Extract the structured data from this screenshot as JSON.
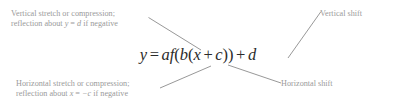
{
  "figure": {
    "background_color": "#ffffff",
    "label_color": "#9a9a9a",
    "equation_color": "#2b2b2b",
    "leader_line_color": "#8c8c8c"
  },
  "equation": {
    "full_text": "y = af(b(x + c)) + d",
    "lhs": "y",
    "equals": "=",
    "a": "a",
    "f": "f",
    "open_f_paren": "(",
    "b": "b",
    "open_inner_paren": "(",
    "x": "x",
    "plus_inner": "+",
    "c": "c",
    "close_inner_paren": ")",
    "close_f_paren": ")",
    "plus_outer": "+",
    "d": "d"
  },
  "callouts": {
    "vertical_stretch": {
      "line1": "Vertical stretch or compression;",
      "line2_pre": "reflection about ",
      "line2_var": "y",
      "line2_eq": " = ",
      "line2_val": "d",
      "line2_post": " if negative"
    },
    "vertical_shift": {
      "line1": "Vertical shift"
    },
    "horizontal_stretch": {
      "line1": "Horizontal stretch or compression;",
      "line2_pre": "reflection about ",
      "line2_var": "x",
      "line2_eq": " = ",
      "line2_val": "−c",
      "line2_post": " if negative"
    },
    "horizontal_shift": {
      "line1": "Horizontal shift"
    }
  }
}
